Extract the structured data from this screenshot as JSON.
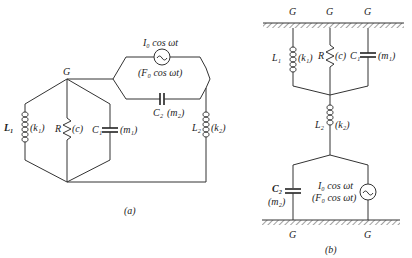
{
  "figure_a": {
    "caption": "(a)",
    "node_label": "G",
    "source": {
      "top_label": "I₀ cos ωt",
      "bottom_label": "(F₀ cos ωt)"
    },
    "c2": {
      "name": "C₂",
      "analog": "(m₂)"
    },
    "l1": {
      "name": "L₁",
      "analog": "(k₁)"
    },
    "r": {
      "name": "R",
      "analog": "(c)"
    },
    "c1": {
      "name": "C₁",
      "analog": "(m₁)"
    },
    "l2": {
      "name": "L₂",
      "analog": "(k₂)"
    }
  },
  "figure_b": {
    "caption": "(b)",
    "ground_top_labels": [
      "G",
      "G",
      "G"
    ],
    "ground_bottom_labels": [
      "G",
      "G"
    ],
    "l1": {
      "name": "L₁",
      "analog": "(k₁)"
    },
    "r": {
      "name": "R",
      "analog": "(c)"
    },
    "c1": {
      "name": "C₁",
      "analog": "(m₁)"
    },
    "l2": {
      "name": "L₂",
      "analog": "(k₂)"
    },
    "c2": {
      "name": "C₂",
      "analog": "(m₂)"
    },
    "source": {
      "top_label": "I₀ cos ωt",
      "bottom_label": "(F₀ cos ωt)"
    }
  }
}
